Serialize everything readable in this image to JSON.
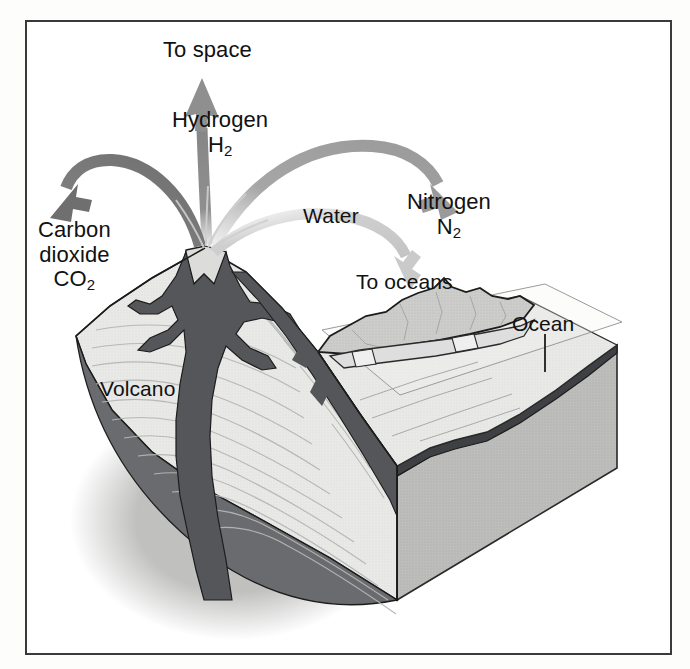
{
  "figure": {
    "type": "block-diagram"
  },
  "labels": {
    "to_space": "To space",
    "hydrogen_name": "Hydrogen",
    "hydrogen_formula_base": "H",
    "hydrogen_formula_sub": "2",
    "carbon_line1": "Carbon",
    "carbon_line2": "dioxide",
    "carbon_formula_base": "CO",
    "carbon_formula_sub": "2",
    "water": "Water",
    "nitrogen_name": "Nitrogen",
    "nitrogen_formula_base": "N",
    "nitrogen_formula_sub": "2",
    "to_oceans": "To oceans",
    "ocean": "Ocean",
    "volcano": "Volcano"
  },
  "arrows": [
    {
      "name": "hydrogen-arrow",
      "label": "Hydrogen H2",
      "destination": "To space",
      "direction": "up",
      "tone": "#8e8e8e"
    },
    {
      "name": "carbon-dioxide-arrow",
      "label": "Carbon dioxide CO2",
      "destination": "atmosphere-left",
      "direction": "arc-left-down",
      "tone": "#777777"
    },
    {
      "name": "nitrogen-arrow",
      "label": "Nitrogen N2",
      "destination": "atmosphere-right",
      "direction": "arc-right-down",
      "tone": "#a8a8a8"
    },
    {
      "name": "water-arrow",
      "label": "Water",
      "destination": "To oceans",
      "direction": "arc-right-down-low",
      "tone": "#cccccc"
    }
  ],
  "scene": {
    "volcano": "cross-section of stratovolcano with central magma conduit and branching dikes",
    "terrain": "mountain ridge and sloping coastal plain",
    "ocean_plane": "transparent ocean surface plane over the basin",
    "block_right_face": "cut-away side of crustal block"
  },
  "colors": {
    "frame": "#3a3a3a",
    "text": "#111111",
    "magma_dark": "#55565a",
    "rock_light": "#e8e8e6",
    "rock_mid": "#c9c9c7",
    "rock_shadow": "#9d9d9b",
    "block_side": "#b4b4b2",
    "strata_line": "#b0b0ae",
    "outline": "#1c1c1c",
    "arrow_dark": "#777777",
    "arrow_mid": "#9a9a9a",
    "arrow_light": "#cccccc"
  }
}
